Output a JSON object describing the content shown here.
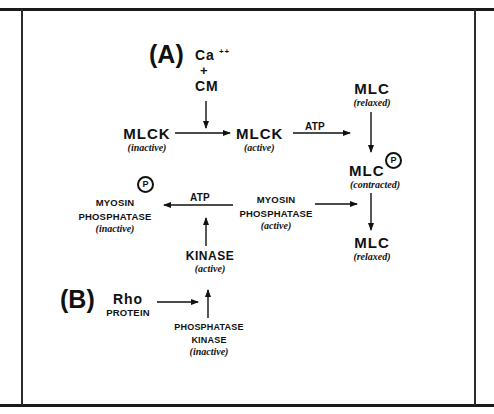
{
  "diagram": {
    "panel_a": {
      "label": "(A)",
      "calcium": "Ca",
      "calcium_charge": "++",
      "plus": "+",
      "calmodulin": "CM",
      "mlck_inactive": {
        "name": "MLCK",
        "state": "(inactive)"
      },
      "mlck_active": {
        "name": "MLCK",
        "state": "(active)"
      },
      "atp_1": "ATP",
      "mlc_relaxed_top": {
        "name": "MLC",
        "state": "(relaxed)"
      },
      "mlc_contracted": {
        "name": "MLC",
        "state": "(contracted)",
        "phospho": "P"
      },
      "mlc_relaxed_bottom": {
        "name": "MLC",
        "state": "(relaxed)"
      },
      "myosin_phosphatase_active": {
        "line1": "MYOSIN",
        "line2": "PHOSPHATASE",
        "state": "(active)"
      },
      "atp_2": "ATP",
      "myosin_phosphatase_inactive": {
        "line1": "MYOSIN",
        "line2": "PHOSPHATASE",
        "state": "(inactive)",
        "phospho": "P"
      },
      "kinase_active": {
        "name": "KINASE",
        "state": "(active)"
      }
    },
    "panel_b": {
      "label": "(B)",
      "rho": {
        "name": "Rho",
        "sub": "PROTEIN"
      },
      "phosphatase_kinase_inactive": {
        "line1": "PHOSPHATASE",
        "line2": "KINASE",
        "state": "(inactive)"
      }
    },
    "edges": [
      {
        "from": "Ca++ + CM",
        "to": "MLCK activation arrow"
      },
      {
        "from": "MLCK (inactive)",
        "to": "MLCK (active)"
      },
      {
        "from": "MLCK (active)",
        "to": "MLC phosphorylation",
        "label": "ATP"
      },
      {
        "from": "MLC (relaxed)",
        "to": "MLC-P (contracted)"
      },
      {
        "from": "MLC-P (contracted)",
        "to": "MLC (relaxed)"
      },
      {
        "from": "MYOSIN PHOSPHATASE (active)",
        "to": "MLC dephosphorylation"
      },
      {
        "from": "MYOSIN PHOSPHATASE (active)",
        "to": "MYOSIN PHOSPHATASE-P (inactive)",
        "label": "ATP"
      },
      {
        "from": "KINASE (active)",
        "to": "ATP phosphorylation arrow"
      },
      {
        "from": "PHOSPHATASE KINASE (inactive)",
        "to": "KINASE (active)"
      },
      {
        "from": "Rho PROTEIN",
        "to": "kinase activation arrow"
      }
    ]
  }
}
